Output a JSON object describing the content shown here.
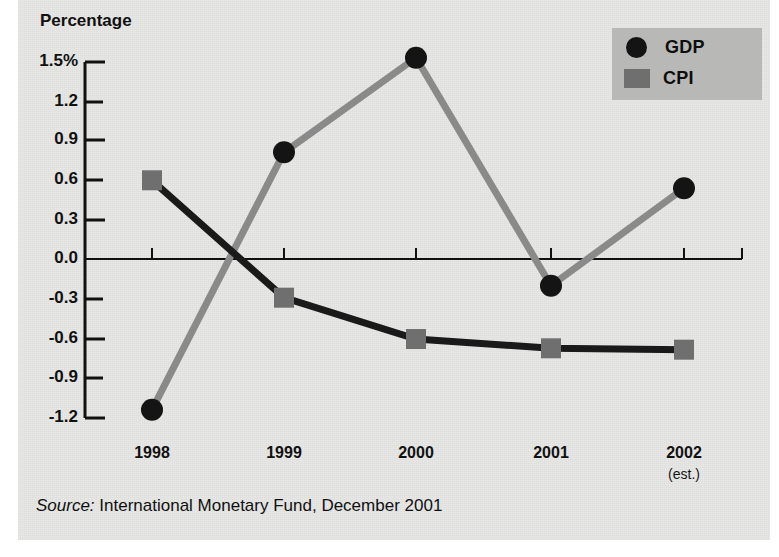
{
  "chart_data": {
    "type": "line",
    "title": "",
    "ylabel": "Percentage",
    "xlabel": "",
    "categories": [
      "1998",
      "1999",
      "2000",
      "2001",
      "2002"
    ],
    "category_sublabels": [
      "",
      "",
      "",
      "",
      "(est.)"
    ],
    "series": [
      {
        "name": "GDP",
        "marker": "circle",
        "marker_color": "#141414",
        "line_color": "#8a8a8a",
        "values": [
          -1.13,
          0.8,
          1.51,
          -0.2,
          0.53
        ]
      },
      {
        "name": "CPI",
        "marker": "square",
        "marker_color": "#6f6f6f",
        "line_color": "#1a1a1a",
        "values": [
          0.59,
          -0.29,
          -0.6,
          -0.67,
          -0.68
        ]
      }
    ],
    "ylim": [
      -1.2,
      1.5
    ],
    "yticks": [
      1.5,
      1.2,
      0.9,
      0.6,
      0.3,
      0.0,
      -0.3,
      -0.6,
      -0.9,
      -1.2
    ],
    "ytick_labels": [
      "1.5%",
      "1.2",
      "0.9",
      "0.6",
      "0.3",
      "0.0",
      "-0.3",
      "-0.6",
      "-0.9",
      "-1.2"
    ],
    "grid": false,
    "zero_line": true,
    "legend_position": "top-right"
  },
  "legend": {
    "entries": [
      {
        "label": "GDP",
        "marker": "circle"
      },
      {
        "label": "CPI",
        "marker": "square"
      }
    ]
  },
  "axis": {
    "y_title": "Percentage"
  },
  "source": {
    "keyword": "Source:",
    "text": " International Monetary Fund, December 2001"
  },
  "colors": {
    "page_background": "#e8e8e6",
    "gdp_line": "#8a8a8a",
    "gdp_marker": "#141414",
    "cpi_line": "#1a1a1a",
    "cpi_marker": "#6f6f6f",
    "legend_background": "#b8b8b6",
    "axis": "#111111"
  }
}
